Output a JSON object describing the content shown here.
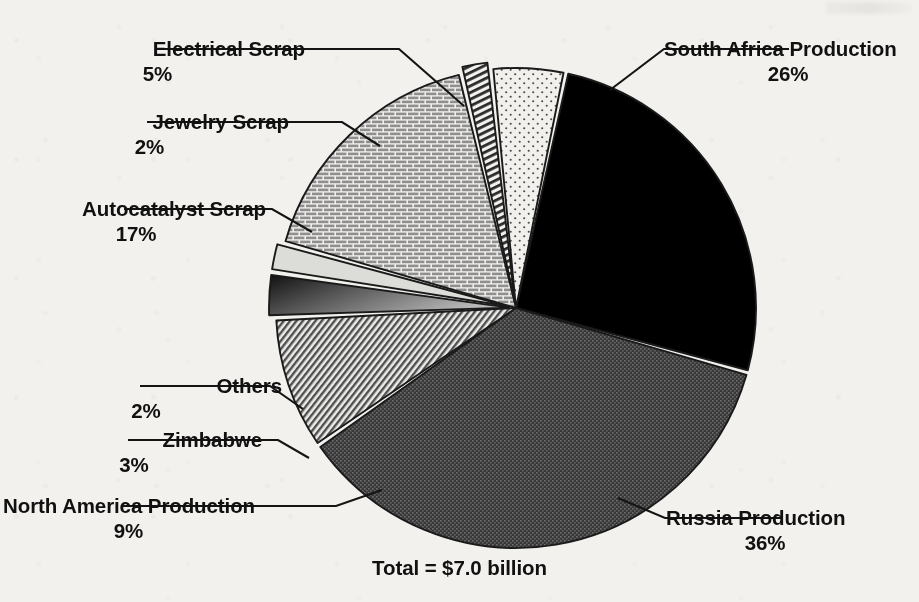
{
  "chart_data": {
    "type": "pie",
    "title": "",
    "total_label": "Total = $7.0 billion",
    "units": "percent of $7.0 billion",
    "categories": [
      "South Africa Production",
      "Russia Production",
      "North America Production",
      "Zimbabwe",
      "Others",
      "Autocatalyst Scrap",
      "Jewelry Scrap",
      "Electrical Scrap"
    ],
    "values": [
      26,
      36,
      9,
      3,
      2,
      17,
      2,
      5
    ],
    "legend_position": "callout-labels",
    "grid": false,
    "slices": [
      {
        "label": "South Africa Production",
        "percent_text": "26%",
        "value": 26,
        "fill": "#000000",
        "pattern": "solid-black",
        "label_side": "right"
      },
      {
        "label": "Russia Production",
        "percent_text": "36%",
        "value": 36,
        "fill": "#4a4a4a",
        "pattern": "dense-stipple",
        "label_side": "right"
      },
      {
        "label": "North America Production",
        "percent_text": "9%",
        "value": 9,
        "fill": "#9a9a9a",
        "pattern": "diagonal-hatch",
        "label_side": "left"
      },
      {
        "label": "Zimbabwe",
        "percent_text": "3%",
        "value": 3,
        "fill": "#6b6b6b",
        "pattern": "gradient-gray",
        "label_side": "left"
      },
      {
        "label": "Others",
        "percent_text": "2%",
        "value": 2,
        "fill": "#d8d8d4",
        "pattern": "light-gray",
        "label_side": "left"
      },
      {
        "label": "Autocatalyst Scrap",
        "percent_text": "17%",
        "value": 17,
        "fill": "#bdbdbd",
        "pattern": "brick",
        "label_side": "left"
      },
      {
        "label": "Jewelry Scrap",
        "percent_text": "2%",
        "value": 2,
        "fill": "#8f8f8f",
        "pattern": "vertical-stripes",
        "label_side": "left"
      },
      {
        "label": "Electrical Scrap",
        "percent_text": "5%",
        "value": 5,
        "fill": "#ececea",
        "pattern": "sparse-dots",
        "label_side": "left"
      }
    ],
    "colors": {
      "background": "#f3f1ed",
      "ink": "#111111",
      "outline": "#1a1a1a"
    }
  }
}
